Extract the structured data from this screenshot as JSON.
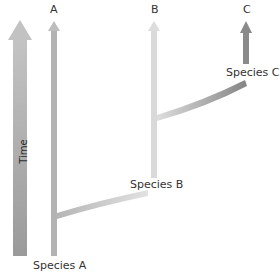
{
  "diagram": {
    "type": "phylogeny-anagenesis-cladogenesis",
    "axis": {
      "label": "Time",
      "direction": "up"
    },
    "lineages": [
      {
        "id": "A",
        "label": "A",
        "color": "#b3b3b3"
      },
      {
        "id": "B",
        "label": "B",
        "color": "#d6d6d6"
      },
      {
        "id": "C",
        "label": "C",
        "color": "#8c8c8c"
      }
    ],
    "species_labels": {
      "a": "Species A",
      "b": "Species B",
      "c": "Species C"
    },
    "branches": [
      {
        "from": "A",
        "to": "B",
        "label": "Species B"
      },
      {
        "from": "B",
        "to": "C",
        "label": "Species C"
      }
    ],
    "colors": {
      "time_arrow": "#a9a9a9",
      "lineage_a": "#b3b3b3",
      "lineage_b": "#d8d8d8",
      "lineage_c": "#8a8a8a",
      "text": "#333333",
      "background": "#ffffff"
    }
  }
}
